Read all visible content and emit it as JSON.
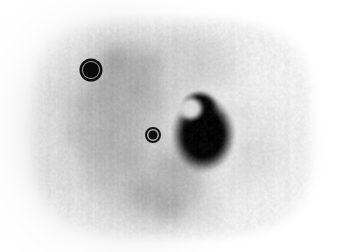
{
  "image": {
    "modality": "nuclear-medicine-axial-slice",
    "width": 338,
    "height": 252,
    "background_color": "#ffffff",
    "colormap": "grayscale-inverted",
    "description": "Grayscale axial torso cross-section, PET/SPECT style, high uptake rendered dark on light background"
  },
  "chart_data": {
    "type": "heatmap",
    "title": "",
    "xlabel": "",
    "ylabel": "",
    "colormap": "grayscale-inverted",
    "value_range": [
      0,
      255
    ],
    "grid": false,
    "legend": "none",
    "body_outline": {
      "name": "torso-cross-section",
      "center_x": 172,
      "center_y": 128,
      "radius_x": 150,
      "radius_y": 118,
      "corner_squareness": 0.42,
      "edge_softness_px": 22,
      "rim_gray": "#efefef"
    },
    "regions": [
      {
        "name": "liver-parenchyma",
        "center_x": 112,
        "center_y": 128,
        "radius_x": 80,
        "radius_y": 90,
        "gray": "#b4b4b4",
        "softness_px": 26,
        "opacity": 1.0
      },
      {
        "name": "liver-upper-lobe",
        "center_x": 128,
        "center_y": 72,
        "radius_x": 52,
        "radius_y": 38,
        "gray": "#a8a8a8",
        "softness_px": 22,
        "opacity": 0.9
      },
      {
        "name": "central-soft-tissue",
        "center_x": 178,
        "center_y": 70,
        "radius_x": 62,
        "radius_y": 34,
        "gray": "#cccccc",
        "softness_px": 24,
        "opacity": 0.85
      },
      {
        "name": "mediastinal-band",
        "center_x": 196,
        "center_y": 48,
        "radius_x": 44,
        "radius_y": 22,
        "gray": "#d4d4d4",
        "softness_px": 20,
        "opacity": 0.8
      },
      {
        "name": "lower-abdominal-mass",
        "center_x": 160,
        "center_y": 196,
        "radius_x": 56,
        "radius_y": 34,
        "gray": "#b8b8b8",
        "softness_px": 24,
        "opacity": 0.9
      },
      {
        "name": "spleen-region",
        "center_x": 176,
        "center_y": 168,
        "radius_x": 30,
        "radius_y": 26,
        "gray": "#b0b0b0",
        "softness_px": 20,
        "opacity": 0.85
      },
      {
        "name": "posterior-rib-arc",
        "center_x": 252,
        "center_y": 150,
        "radius_x": 46,
        "radius_y": 44,
        "gray": "#d8d8d8",
        "softness_px": 16,
        "opacity": 0.7
      },
      {
        "name": "right-lateral-wall",
        "center_x": 58,
        "center_y": 140,
        "radius_x": 26,
        "radius_y": 62,
        "gray": "#dcdcdc",
        "softness_px": 22,
        "opacity": 0.75
      }
    ],
    "hot_spot": {
      "name": "primary-uptake-focus",
      "center_x": 203,
      "center_y": 134,
      "radius_x": 26,
      "radius_y": 31,
      "core_gray": "#050505",
      "halo_gray": "#2a2a2a",
      "softness_px": 9,
      "notch": {
        "center_x": 190,
        "center_y": 108,
        "radius": 14,
        "gray": "#d8d8d8"
      }
    },
    "roi_markers": [
      {
        "name": "roi-marker-upper-left",
        "label": "",
        "center_x": 91,
        "center_y": 70,
        "core_radius": 8,
        "ring_inner_radius": 9,
        "ring_outer_radius": 11.5,
        "core_color": "#090909",
        "ring_color": "#111111",
        "gap_color": "#9a9a9a"
      },
      {
        "name": "roi-marker-central",
        "label": "",
        "center_x": 153,
        "center_y": 135,
        "core_radius": 4.5,
        "ring_inner_radius": 6,
        "ring_outer_radius": 8,
        "core_color": "#0d0d0d",
        "ring_color": "#151515",
        "gap_color": "#a6a6a6"
      }
    ],
    "noise": {
      "name": "acquisition-noise",
      "amplitude": 11,
      "vertical_streak_amplitude": 6,
      "grain_scale_px": 2
    },
    "blobs": [
      {
        "name": "texture-blob",
        "cx": 84,
        "cy": 104,
        "r": 16,
        "gray": 168,
        "alpha": 0.55
      },
      {
        "name": "texture-blob",
        "cx": 104,
        "cy": 92,
        "r": 14,
        "gray": 160,
        "alpha": 0.5
      },
      {
        "name": "texture-blob",
        "cx": 120,
        "cy": 118,
        "r": 18,
        "gray": 166,
        "alpha": 0.5
      },
      {
        "name": "texture-blob",
        "cx": 96,
        "cy": 148,
        "r": 17,
        "gray": 170,
        "alpha": 0.5
      },
      {
        "name": "texture-blob",
        "cx": 128,
        "cy": 158,
        "r": 15,
        "gray": 164,
        "alpha": 0.5
      },
      {
        "name": "texture-blob",
        "cx": 76,
        "cy": 132,
        "r": 14,
        "gray": 174,
        "alpha": 0.45
      },
      {
        "name": "texture-blob",
        "cx": 138,
        "cy": 88,
        "r": 16,
        "gray": 156,
        "alpha": 0.55
      },
      {
        "name": "texture-blob",
        "cx": 116,
        "cy": 62,
        "r": 15,
        "gray": 152,
        "alpha": 0.6
      },
      {
        "name": "texture-blob",
        "cx": 148,
        "cy": 64,
        "r": 13,
        "gray": 158,
        "alpha": 0.5
      },
      {
        "name": "texture-blob",
        "cx": 150,
        "cy": 102,
        "r": 14,
        "gray": 176,
        "alpha": 0.45
      },
      {
        "name": "texture-blob",
        "cx": 104,
        "cy": 176,
        "r": 16,
        "gray": 178,
        "alpha": 0.45
      },
      {
        "name": "texture-blob",
        "cx": 142,
        "cy": 190,
        "r": 18,
        "gray": 160,
        "alpha": 0.55
      },
      {
        "name": "texture-blob",
        "cx": 170,
        "cy": 204,
        "r": 17,
        "gray": 158,
        "alpha": 0.55
      },
      {
        "name": "texture-blob",
        "cx": 190,
        "cy": 186,
        "r": 15,
        "gray": 176,
        "alpha": 0.45
      },
      {
        "name": "texture-blob",
        "cx": 178,
        "cy": 166,
        "r": 16,
        "gray": 168,
        "alpha": 0.5
      },
      {
        "name": "texture-blob",
        "cx": 200,
        "cy": 60,
        "r": 18,
        "gray": 196,
        "alpha": 0.45
      },
      {
        "name": "texture-blob",
        "cx": 222,
        "cy": 72,
        "r": 16,
        "gray": 206,
        "alpha": 0.4
      },
      {
        "name": "texture-blob",
        "cx": 176,
        "cy": 46,
        "r": 15,
        "gray": 200,
        "alpha": 0.4
      },
      {
        "name": "texture-blob",
        "cx": 240,
        "cy": 112,
        "r": 16,
        "gray": 212,
        "alpha": 0.4
      },
      {
        "name": "texture-blob",
        "cx": 252,
        "cy": 158,
        "r": 18,
        "gray": 208,
        "alpha": 0.4
      },
      {
        "name": "texture-blob",
        "cx": 236,
        "cy": 180,
        "r": 16,
        "gray": 214,
        "alpha": 0.35
      },
      {
        "name": "texture-blob",
        "cx": 60,
        "cy": 96,
        "r": 16,
        "gray": 206,
        "alpha": 0.4
      },
      {
        "name": "texture-blob",
        "cx": 56,
        "cy": 170,
        "r": 17,
        "gray": 212,
        "alpha": 0.35
      },
      {
        "name": "texture-blob",
        "cx": 206,
        "cy": 210,
        "r": 16,
        "gray": 206,
        "alpha": 0.35
      },
      {
        "name": "texture-blob",
        "cx": 272,
        "cy": 120,
        "r": 18,
        "gray": 224,
        "alpha": 0.3
      }
    ]
  }
}
